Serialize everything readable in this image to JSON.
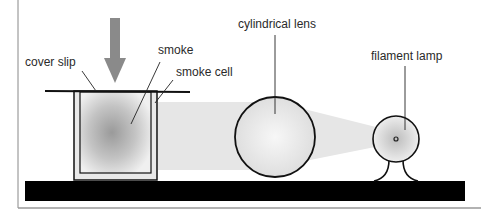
{
  "diagram": {
    "labels": {
      "cover_slip": "cover slip",
      "smoke": "smoke",
      "smoke_cell": "smoke cell",
      "cylindrical_lens": "cylindrical lens",
      "filament_lamp": "filament lamp"
    },
    "icons": {
      "view_arrow": "down-arrow-icon"
    },
    "colors": {
      "arrow": "#8a8a8a",
      "bench": "#000000",
      "beam": "#e6e6e6",
      "outline": "#111111",
      "frame": "#888888"
    }
  }
}
